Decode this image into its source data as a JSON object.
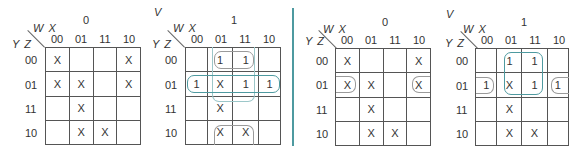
{
  "variables": {
    "v": "V",
    "wx": "W X",
    "yz": "Y Z"
  },
  "column_headers": [
    "00",
    "01",
    "11",
    "10"
  ],
  "row_headers": [
    "00",
    "01",
    "11",
    "10"
  ],
  "colors": {
    "teal": "#4e9aa0",
    "gray_loop": "#9a9a9a",
    "grid": "#555555"
  },
  "left_panel": {
    "map0": {
      "v_value": "0",
      "cells": [
        [
          "X",
          "",
          "",
          "X"
        ],
        [
          "X",
          "X",
          "",
          "X"
        ],
        [
          "",
          "X",
          "",
          ""
        ],
        [
          "",
          "X",
          "X",
          ""
        ]
      ]
    },
    "map1": {
      "v_label": "V",
      "v_value": "1",
      "cells": [
        [
          "",
          "1",
          "1",
          ""
        ],
        [
          "1",
          "X",
          "1",
          "1"
        ],
        [
          "",
          "X",
          "",
          ""
        ],
        [
          "",
          "X",
          "X",
          ""
        ]
      ]
    }
  },
  "right_panel": {
    "map0": {
      "v_value": "0",
      "cells": [
        [
          "X",
          "",
          "",
          "X"
        ],
        [
          "X",
          "X",
          "",
          "X"
        ],
        [
          "",
          "X",
          "",
          ""
        ],
        [
          "",
          "X",
          "X",
          ""
        ]
      ]
    },
    "map1": {
      "v_label": "V",
      "v_value": "1",
      "cells": [
        [
          "",
          "1",
          "1",
          ""
        ],
        [
          "1",
          "X",
          "1",
          "1"
        ],
        [
          "",
          "X",
          "",
          ""
        ],
        [
          "",
          "X",
          "X",
          ""
        ]
      ]
    }
  }
}
